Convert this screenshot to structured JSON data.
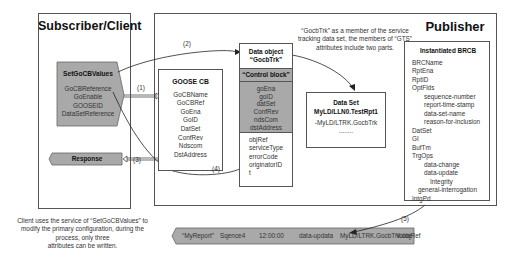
{
  "subscriber": {
    "title": "Subscriber/Client",
    "set_values": {
      "title": "SetGoCBValues",
      "items": [
        "GoCBReference",
        "GoEnable",
        "GOOSEID",
        "DataSetReference"
      ]
    },
    "response": "Response",
    "caption": [
      "Client uses the service of “SetGoCBValues” to",
      "modify the primary configuration, during the",
      "process, only three",
      "attributes can be written."
    ]
  },
  "publisher": {
    "title": "Publisher",
    "goose_cb": {
      "title": "GOOSE CB",
      "items": [
        "GoCBName",
        "GoCBRef",
        "GoEna",
        "GoID",
        "DatSet",
        "ConfRev",
        "Ndscom",
        "DstAddress"
      ]
    },
    "data_object": {
      "title_line1": "Data object",
      "title_line2": "“GocbTrk”",
      "control_block": "“Control block”",
      "cb_items": [
        "goEna",
        "goID",
        "datSet",
        "ConfRev",
        "ndsCom",
        "dstAddress"
      ],
      "extra_items": [
        "objRef",
        "serviceType",
        "errorCode",
        "originatorID",
        "t"
      ]
    },
    "note": [
      "“GocbTrk” as a member of the service",
      "tracking data set, the members of “GTS”",
      "attributes include two parts."
    ],
    "data_set": {
      "title": "Data Set",
      "name": "MyLD/LLN0.TestRpt1",
      "member": "-MyLD/LTRK.GocbTrk",
      "ellipsis": "........"
    },
    "brcb": {
      "title": "Instantiated BRCB",
      "items": [
        {
          "label": "BRCName",
          "indent": 0
        },
        {
          "label": "RptEna",
          "indent": 0
        },
        {
          "label": "RptID",
          "indent": 0
        },
        {
          "label": "OptFlds",
          "indent": 0
        },
        {
          "label": "sequence-number",
          "indent": 2
        },
        {
          "label": "report-time-stamp",
          "indent": 2
        },
        {
          "label": "data-set-name",
          "indent": 2
        },
        {
          "label": "reason-for-inclusion",
          "indent": 2
        },
        {
          "label": "DatSet",
          "indent": 0
        },
        {
          "label": "GI",
          "indent": 0
        },
        {
          "label": "BufTm",
          "indent": 0
        },
        {
          "label": "TrgOps",
          "indent": 0
        },
        {
          "label": "data-change",
          "indent": 2
        },
        {
          "label": "data-update",
          "indent": 2
        },
        {
          "label": "Integrity",
          "indent": 3
        },
        {
          "label": "general-interrogation",
          "indent": 1
        },
        {
          "label": "IntgPd",
          "indent": 0
        }
      ]
    }
  },
  "arrows": {
    "a1": "(1)",
    "a2": "(2)",
    "a3": "(3)",
    "a4": "(4)",
    "a5": "(5)"
  },
  "report": {
    "fields": [
      "“MyReport”",
      "Sqence4",
      "12:00:00",
      "data-updata",
      "MyLD/LTRK.GocbTrk.objRef",
      "Value"
    ]
  },
  "colors": {
    "grey_fill": "#a9a9a9",
    "border": "#555555"
  }
}
